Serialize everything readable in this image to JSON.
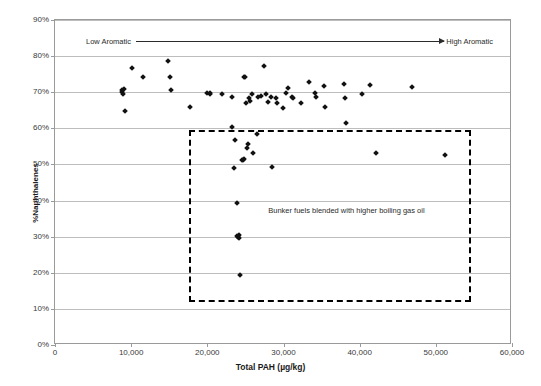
{
  "chart_data": {
    "type": "scatter",
    "title": "",
    "xlabel": "Total PAH (µg/kg)",
    "ylabel": "%Naphthalenes",
    "xlim": [
      0,
      60000
    ],
    "ylim": [
      0,
      0.9
    ],
    "xticks": [
      0,
      10000,
      20000,
      30000,
      40000,
      50000,
      60000
    ],
    "xticklabels": [
      "0",
      "10,000",
      "20,000",
      "30,000",
      "40,000",
      "50,000",
      "60,000"
    ],
    "yticks": [
      0,
      0.1,
      0.2,
      0.3,
      0.4,
      0.5,
      0.6,
      0.7,
      0.8,
      0.9
    ],
    "yticklabels": [
      "0%",
      "10%",
      "20%",
      "30%",
      "40%",
      "50%",
      "60%",
      "70%",
      "80%",
      "90%"
    ],
    "grid": "horizontal",
    "legend": "none",
    "series": [
      {
        "name": "Fuel samples",
        "marker": "diamond",
        "color": "#111111",
        "points": [
          [
            8800,
            0.705
          ],
          [
            8850,
            0.7
          ],
          [
            8900,
            0.695
          ],
          [
            9000,
            0.71
          ],
          [
            9150,
            0.648
          ],
          [
            10100,
            0.766
          ],
          [
            11550,
            0.742
          ],
          [
            14800,
            0.787
          ],
          [
            15100,
            0.742
          ],
          [
            15200,
            0.707
          ],
          [
            17700,
            0.659
          ],
          [
            19900,
            0.697
          ],
          [
            20350,
            0.695
          ],
          [
            20400,
            0.697
          ],
          [
            21900,
            0.694
          ],
          [
            23200,
            0.603
          ],
          [
            23300,
            0.688
          ],
          [
            23450,
            0.49
          ],
          [
            23600,
            0.568
          ],
          [
            23900,
            0.392
          ],
          [
            23950,
            0.303
          ],
          [
            24050,
            0.3
          ],
          [
            24150,
            0.305
          ],
          [
            24200,
            0.296
          ],
          [
            24300,
            0.193
          ],
          [
            24600,
            0.513
          ],
          [
            24650,
            0.512
          ],
          [
            24750,
            0.514
          ],
          [
            24800,
            0.742
          ],
          [
            24950,
            0.741
          ],
          [
            25100,
            0.669
          ],
          [
            25250,
            0.546
          ],
          [
            25350,
            0.556
          ],
          [
            25500,
            0.684
          ],
          [
            25650,
            0.676
          ],
          [
            25900,
            0.694
          ],
          [
            26050,
            0.533
          ],
          [
            26500,
            0.583
          ],
          [
            26600,
            0.688
          ],
          [
            27050,
            0.69
          ],
          [
            27450,
            0.772
          ],
          [
            27700,
            0.696
          ],
          [
            27900,
            0.672
          ],
          [
            28400,
            0.686
          ],
          [
            28550,
            0.494
          ],
          [
            29050,
            0.684
          ],
          [
            29100,
            0.671
          ],
          [
            29900,
            0.657
          ],
          [
            30300,
            0.698
          ],
          [
            30650,
            0.713
          ],
          [
            31100,
            0.686
          ],
          [
            31300,
            0.683
          ],
          [
            32350,
            0.671
          ],
          [
            33300,
            0.728
          ],
          [
            34100,
            0.698
          ],
          [
            34300,
            0.688
          ],
          [
            35300,
            0.717
          ],
          [
            35500,
            0.659
          ],
          [
            38000,
            0.724
          ],
          [
            38100,
            0.684
          ],
          [
            38200,
            0.616
          ],
          [
            40300,
            0.695
          ],
          [
            41400,
            0.719
          ],
          [
            42100,
            0.533
          ],
          [
            46900,
            0.715
          ],
          [
            51200,
            0.525
          ]
        ]
      }
    ],
    "annotations": [
      {
        "id": "aromatic-gradient",
        "type": "arrow",
        "left_label": "Low Aromatic",
        "right_label": "High Aromatic",
        "y": 0.85
      },
      {
        "id": "bunker-box",
        "type": "dashed-rect",
        "text": "Bunker fuels blended with higher boiling gas oil",
        "x_range": [
          17600,
          54600
        ],
        "y_range": [
          0.12,
          0.595
        ],
        "text_x": 28000,
        "text_y": 0.385
      }
    ]
  },
  "caption": {
    "text": ""
  }
}
